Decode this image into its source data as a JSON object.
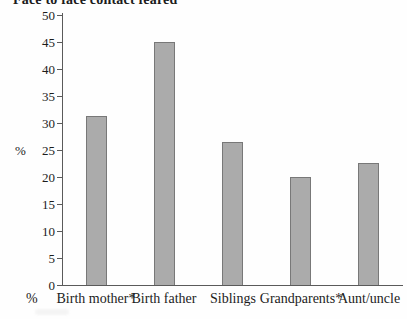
{
  "figure": {
    "title_cropped": "Face to face contact feared",
    "x_axis_row_unit": "%"
  },
  "chart_data": {
    "type": "bar",
    "title": "Face to face contact feared",
    "categories": [
      "Birth mother*",
      "Birth father",
      "Siblings",
      "Grandparents*",
      "Aunt/uncle"
    ],
    "values": [
      31.3,
      45,
      26.5,
      20,
      22.5
    ],
    "xlabel": "",
    "ylabel": "%",
    "ylim": [
      0,
      50
    ],
    "yticks": [
      0,
      5,
      10,
      15,
      20,
      25,
      30,
      35,
      40,
      45,
      50
    ],
    "grid": false,
    "legend": "none",
    "colors": {
      "bar_fill": "#ababab",
      "bar_border": "#787878",
      "axis": "#5a5a5a",
      "text": "#1c1c1c",
      "background": "#fefefe"
    }
  }
}
